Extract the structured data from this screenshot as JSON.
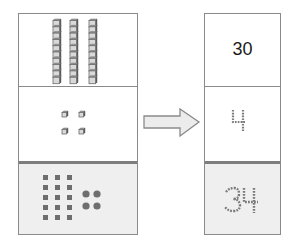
{
  "diagram": {
    "left_panel": {
      "rows": [
        {
          "kind": "tens-rods",
          "count": 3,
          "cubes_per_rod": 10
        },
        {
          "kind": "ones-cubes",
          "count": 4
        },
        {
          "kind": "pictorial",
          "squares_columns": 3,
          "squares_rows": 5,
          "dots": 4
        }
      ]
    },
    "arrow": {
      "direction": "right",
      "fill": "#ececec",
      "stroke": "#8a8a8a"
    },
    "right_panel": {
      "rows": [
        {
          "label": "30",
          "style": "solid"
        },
        {
          "label": "4",
          "style": "dotted"
        },
        {
          "label": "34",
          "style": "dotted"
        }
      ]
    },
    "colors": {
      "border": "#8a8a8a",
      "divider_strong": "#7d7d7d",
      "shaded_cell": "#efefef",
      "block_fill": "#d9d9d9",
      "block_edge": "#6b6b6b",
      "pictorial_mark": "#6e6e6e",
      "dotted_digit": "#7a7a7a"
    }
  }
}
